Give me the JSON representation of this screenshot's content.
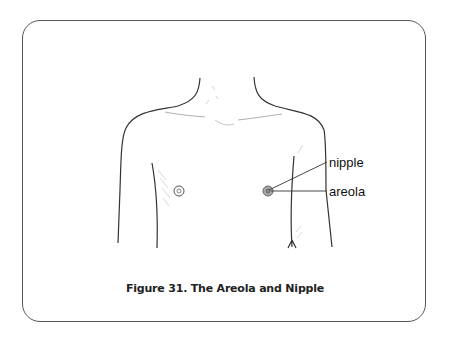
{
  "figure": {
    "caption": "Figure 31. The Areola and Nipple",
    "labels": {
      "nipple": "nipple",
      "areola": "areola"
    }
  },
  "colors": {
    "line": "#333333",
    "border": "#555555",
    "areola_fill": "#aaaaaa"
  }
}
